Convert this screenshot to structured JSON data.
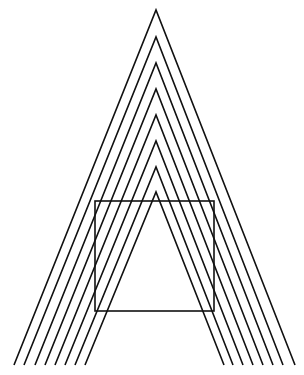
{
  "figure": {
    "stroke_color": "#111111",
    "background": "#ffffff",
    "chevrons": [
      {
        "apex": [
          156,
          10
        ],
        "left": [
          14,
          365
        ],
        "right": [
          295,
          365
        ]
      },
      {
        "apex": [
          156,
          37
        ],
        "left": [
          24,
          365
        ],
        "right": [
          283,
          365
        ]
      },
      {
        "apex": [
          156,
          63
        ],
        "left": [
          35,
          365
        ],
        "right": [
          273,
          365
        ]
      },
      {
        "apex": [
          156,
          89
        ],
        "left": [
          45,
          365
        ],
        "right": [
          263,
          365
        ]
      },
      {
        "apex": [
          156,
          115
        ],
        "left": [
          55,
          365
        ],
        "right": [
          253,
          365
        ]
      },
      {
        "apex": [
          156,
          141
        ],
        "left": [
          65,
          365
        ],
        "right": [
          243,
          365
        ]
      },
      {
        "apex": [
          156,
          167
        ],
        "left": [
          75,
          365
        ],
        "right": [
          233,
          365
        ]
      },
      {
        "apex": [
          156,
          192
        ],
        "left": [
          85,
          365
        ],
        "right": [
          224,
          365
        ]
      }
    ],
    "square": {
      "x": 95,
      "y": 201,
      "width": 119,
      "height": 110
    }
  }
}
